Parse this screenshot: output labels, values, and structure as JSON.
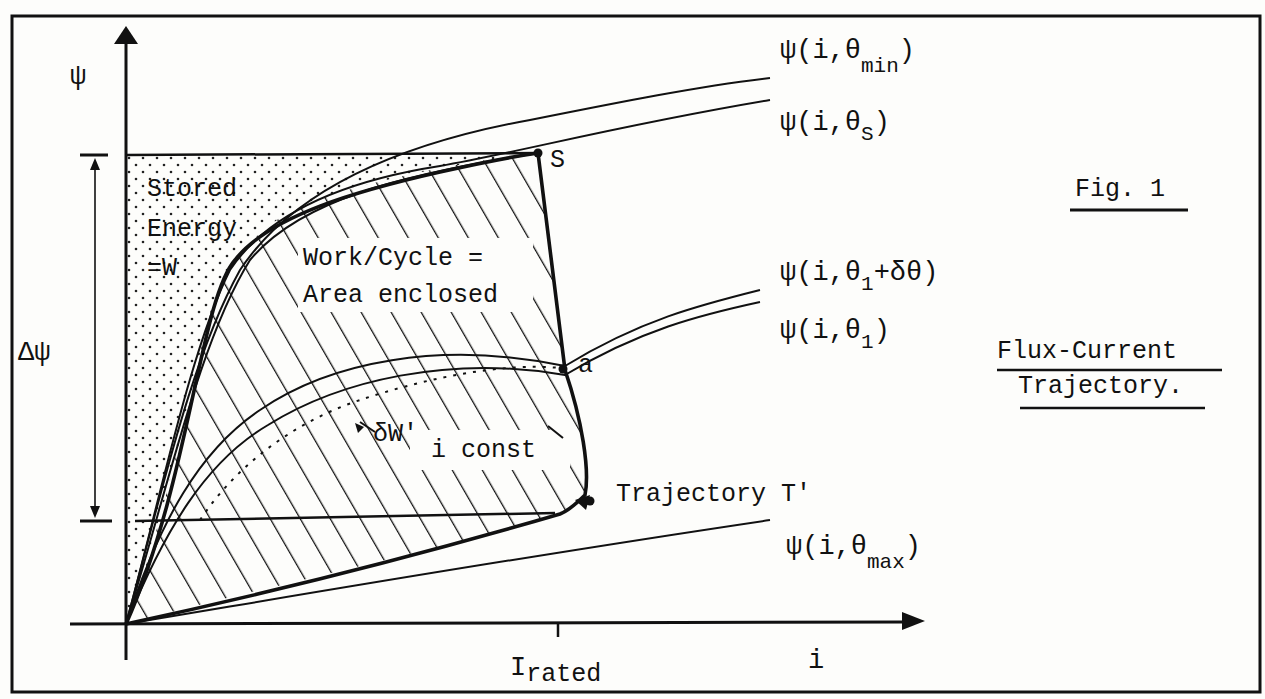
{
  "figure": {
    "title": "Fig. 1",
    "caption_line1": "Flux-Current",
    "caption_line2": "Trajectory."
  },
  "axes": {
    "y_label": "ψ",
    "x_label": "i",
    "x_tick_main": "I",
    "x_tick_sub": "rated",
    "delta_label": "Δψ"
  },
  "regions": {
    "stored_line1": "Stored",
    "stored_line2": "Energy",
    "stored_line3": "=W",
    "work_line1": "Work/Cycle =",
    "work_line2": "Area enclosed",
    "i_const": "i const",
    "delta_w": "δW'",
    "trajectory": "Trajectory T'"
  },
  "points": {
    "s": "S",
    "a": "a"
  },
  "curves": [
    {
      "id": "theta_min",
      "prefix": "ψ(i,θ",
      "sub": "min",
      "suffix": ")"
    },
    {
      "id": "theta_s",
      "prefix": "ψ(i,θ",
      "sub": "S",
      "suffix": ")"
    },
    {
      "id": "theta_1_plus",
      "prefix": "ψ(i,θ",
      "sub": "1",
      "suffix": "+δθ)"
    },
    {
      "id": "theta_1",
      "prefix": "ψ(i,θ",
      "sub": "1",
      "suffix": ")"
    },
    {
      "id": "theta_max",
      "prefix": "ψ(i,θ",
      "sub": "max",
      "suffix": ")"
    }
  ],
  "colors": {
    "ink": "#111111",
    "paper": "#fdfdfb"
  }
}
